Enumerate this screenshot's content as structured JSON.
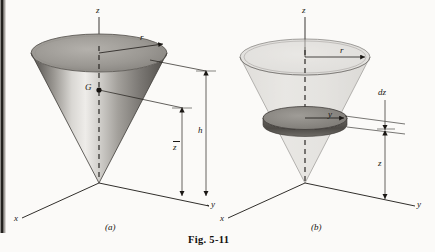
{
  "figure": {
    "caption": "Fig. 5-11",
    "panels": [
      {
        "id": "a",
        "sublabel": "(a)",
        "description": "solid-shaded-inverted-cone",
        "labels": {
          "z_axis": "z",
          "y_axis": "y",
          "x_axis": "x",
          "radius": "r",
          "centroid_point": "G",
          "centroid_height": "z",
          "centroid_height_overbar": true,
          "total_height": "h"
        }
      },
      {
        "id": "b",
        "sublabel": "(b)",
        "description": "translucent-inverted-cone-with-disk-element",
        "labels": {
          "z_axis": "z",
          "y_axis": "y",
          "x_axis": "x",
          "radius": "r",
          "disk_radius": "y",
          "disk_thickness": "dz",
          "disk_height": "z"
        }
      }
    ]
  },
  "colors": {
    "page_background": "#fbfaf8",
    "ink": "#1a1714",
    "cone_dark": "#4a4743",
    "cone_highlight": "#e8e6e2",
    "cone_mid": "#8d8a85",
    "top_face": "#9d9a95",
    "translucent_fill": "#d5d3cf",
    "disk_top": "#8a8884",
    "disk_side": "#55534f"
  }
}
